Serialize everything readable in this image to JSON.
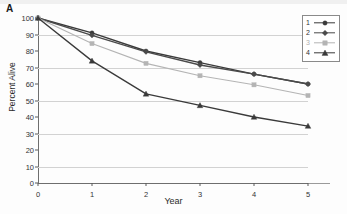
{
  "panel": {
    "label": "A"
  },
  "axes": {
    "ylabel": "Percent Alive",
    "xlabel": "Year",
    "yticks": [
      "0",
      "10",
      "20",
      "30",
      "40",
      "50",
      "60",
      "70",
      "80",
      "90",
      "100"
    ],
    "xticks": [
      "0",
      "1",
      "2",
      "3",
      "4",
      "5"
    ]
  },
  "legend": {
    "items": [
      {
        "key": "1",
        "color": "#3a3a3a",
        "marker": "circle"
      },
      {
        "key": "2",
        "color": "#4a4a4a",
        "marker": "diamond"
      },
      {
        "key": "3",
        "color": "#b4b4b4",
        "marker": "square"
      },
      {
        "key": "4",
        "color": "#3a3a3a",
        "marker": "triangle"
      }
    ]
  },
  "chart_data": {
    "type": "line",
    "title": "A",
    "xlabel": "Year",
    "ylabel": "Percent Alive",
    "x": [
      0,
      1,
      2,
      3,
      4,
      5
    ],
    "xlim": [
      0,
      5
    ],
    "ylim": [
      0,
      100
    ],
    "ytick_step": 10,
    "gridlines": [
      10,
      30,
      50,
      70,
      90
    ],
    "grid": true,
    "legend_position": "top-right",
    "series": [
      {
        "name": "1",
        "color": "#3a3a3a",
        "marker": "circle",
        "values": [
          100,
          91,
          80,
          73,
          66,
          60
        ]
      },
      {
        "name": "2",
        "color": "#4a4a4a",
        "marker": "diamond",
        "values": [
          100,
          89.5,
          79.5,
          71.5,
          66,
          60
        ]
      },
      {
        "name": "3",
        "color": "#b4b4b4",
        "marker": "square",
        "values": [
          100,
          84.5,
          72.5,
          65,
          59.5,
          53
        ]
      },
      {
        "name": "4",
        "color": "#3a3a3a",
        "marker": "triangle",
        "values": [
          100,
          74,
          54,
          47,
          40,
          34.5
        ]
      }
    ]
  }
}
